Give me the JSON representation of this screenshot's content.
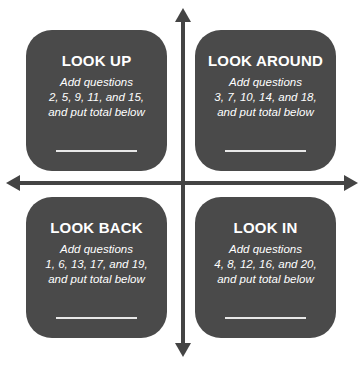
{
  "diagram": {
    "type": "quadrant",
    "axes": {
      "vertical": {
        "arrows": [
          "up",
          "down"
        ]
      },
      "horizontal": {
        "arrows": [
          "left",
          "right"
        ]
      },
      "color": "#444444"
    },
    "box_color": "#4a4a4a",
    "quadrants": [
      {
        "position": "top-left",
        "title": "LOOK UP",
        "lines": [
          "Add questions",
          "2, 5, 9, 11, and 15,",
          "and put total below"
        ],
        "questions": [
          2,
          5,
          9,
          11,
          15
        ]
      },
      {
        "position": "top-right",
        "title": "LOOK AROUND",
        "lines": [
          "Add questions",
          "3, 7, 10, 14, and 18,",
          "and put total below"
        ],
        "questions": [
          3,
          7,
          10,
          14,
          18
        ]
      },
      {
        "position": "bottom-left",
        "title": "LOOK BACK",
        "lines": [
          "Add questions",
          "1, 6, 13, 17, and 19,",
          "and put total below"
        ],
        "questions": [
          1,
          6,
          13,
          17,
          19
        ]
      },
      {
        "position": "bottom-right",
        "title": "LOOK IN",
        "lines": [
          "Add questions",
          "4, 8, 12, 16, and 20,",
          "and put total below"
        ],
        "questions": [
          4,
          8,
          12,
          16,
          20
        ]
      }
    ]
  }
}
